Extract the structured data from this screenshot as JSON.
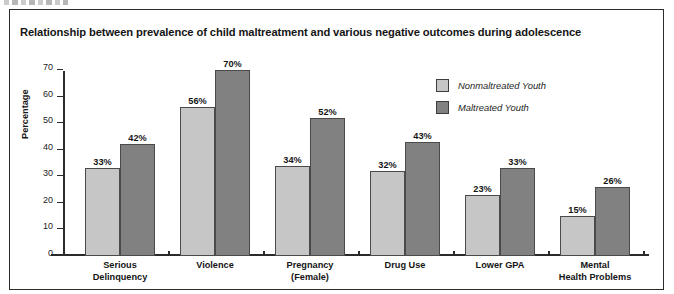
{
  "figure": {
    "title": "Relationship between prevalence of child maltreatment and various negative outcomes during adolescence",
    "top_fragment": ""
  },
  "colors": {
    "nonmaltreated_fill": "#c6c6c6",
    "maltreated_fill": "#818181",
    "bar_border": "#4a4a4a",
    "axis": "#2b2b2b",
    "text": "#151515",
    "frame": "#2b2b2b",
    "background": "#ffffff"
  },
  "chart_data": {
    "type": "bar",
    "title": "Relationship between prevalence of child maltreatment and various negative outcomes during adolescence",
    "xlabel": "",
    "ylabel": "Percentage",
    "ylim": [
      0,
      70
    ],
    "yticks": [
      0,
      10,
      20,
      30,
      40,
      50,
      60,
      70
    ],
    "ytick_labels": [
      "0",
      "10",
      "20",
      "30",
      "40",
      "50",
      "60",
      "70"
    ],
    "grid": false,
    "legend_position": "upper right inside",
    "categories": [
      "Serious\nDelinquency",
      "Violence",
      "Pregnancy\n(Female)",
      "Drug Use",
      "Lower GPA",
      "Mental\nHealth Problems"
    ],
    "category_lines": [
      [
        "Serious",
        "Delinquency"
      ],
      [
        "Violence",
        ""
      ],
      [
        "Pregnancy",
        "(Female)"
      ],
      [
        "Drug Use",
        ""
      ],
      [
        "Lower GPA",
        ""
      ],
      [
        "Mental",
        "Health Problems"
      ]
    ],
    "series": [
      {
        "name": "Nonmaltreated Youth",
        "color": "#c6c6c6",
        "values": [
          33,
          56,
          34,
          32,
          23,
          15
        ],
        "data_labels": [
          "33%",
          "56%",
          "34%",
          "32%",
          "23%",
          "15%"
        ]
      },
      {
        "name": "Maltreated Youth",
        "color": "#818181",
        "values": [
          42,
          70,
          52,
          43,
          33,
          26
        ],
        "data_labels": [
          "42%",
          "70%",
          "52%",
          "43%",
          "33%",
          "26%"
        ]
      }
    ]
  }
}
